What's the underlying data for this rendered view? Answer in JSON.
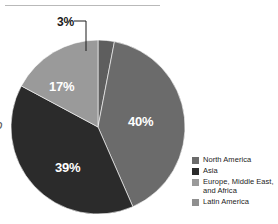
{
  "chart_data": {
    "type": "pie",
    "title": "",
    "subtitle": "",
    "xlabel": "",
    "ylabel": "",
    "legend_position": "right",
    "grid": false,
    "categories": [
      "North America",
      "Asia",
      "Europe, Middle East, and Africa",
      "Latin America"
    ],
    "values": [
      40,
      39,
      17,
      3
    ],
    "value_labels": [
      "40%",
      "39%",
      "17%",
      "3%"
    ],
    "colors": [
      "#6b6b6b",
      "#2b2b2b",
      "#9a9a9a",
      "#5e5e5e"
    ],
    "start_angle_deg": 0,
    "direction": "clockwise",
    "annotations": [
      "3%"
    ],
    "slices": [
      {
        "label": "3%",
        "value": 3,
        "category": "Latin America",
        "color": "#5e5e5e",
        "label_color": "#1a1a1a",
        "callout": true
      },
      {
        "label": "40%",
        "value": 40,
        "category": "North America",
        "color": "#6b6b6b",
        "label_color": "#ffffff",
        "callout": false
      },
      {
        "label": "39%",
        "value": 39,
        "category": "Asia",
        "color": "#2b2b2b",
        "label_color": "#ffffff",
        "callout": false
      },
      {
        "label": "17%",
        "value": 17,
        "category": "Europe, Middle East, and Africa",
        "color": "#9a9a9a",
        "label_color": "#ffffff",
        "callout": false
      }
    ]
  },
  "legend": {
    "items": [
      {
        "label": "North America",
        "color": "#6b6b6b"
      },
      {
        "label": "Asia",
        "color": "#2b2b2b"
      },
      {
        "label": "Europe, Middle East, and Africa",
        "color": "#9a9a9a"
      },
      {
        "label": "Latin America",
        "color": "#8f8f8f"
      }
    ]
  },
  "decor": {
    "top_rule_color": "#b9b9b9",
    "edge_glyph": "ɔ",
    "leader_color": "#1a1a1a",
    "background": "#ffffff"
  }
}
